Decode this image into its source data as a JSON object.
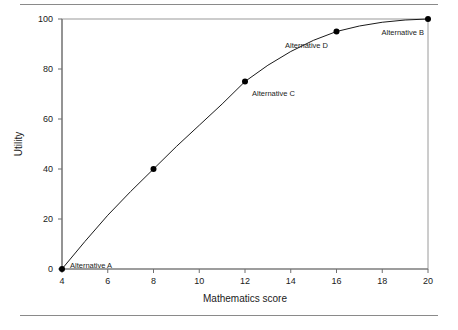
{
  "figure": {
    "background_color": "#ffffff",
    "rule_color": "#8a8a8a",
    "has_top_rule": true,
    "has_bottom_rule": true
  },
  "chart_data": {
    "type": "line",
    "title": "",
    "xlabel": "Mathematics score",
    "ylabel": "Utility",
    "xlim": [
      4,
      20
    ],
    "ylim": [
      0,
      100
    ],
    "xticks": [
      4,
      6,
      8,
      10,
      12,
      14,
      16,
      18,
      20
    ],
    "xtick_labels": [
      "4",
      "6",
      "8",
      "10",
      "12",
      "14",
      "16",
      "18",
      "20"
    ],
    "yticks": [
      0,
      20,
      40,
      60,
      80,
      100
    ],
    "ytick_labels": [
      "0",
      "20",
      "40",
      "60",
      "80",
      "100"
    ],
    "grid": false,
    "legend": false,
    "legend_position": "none",
    "line_color": "#1a1a1a",
    "marker_color": "#000000",
    "marker_style": "filled-circle",
    "frame": true,
    "series": [
      {
        "name": "Utility curve",
        "x": [
          4,
          8,
          12,
          16,
          20
        ],
        "values": [
          0,
          40,
          75,
          95,
          100
        ],
        "point_labels": [
          "Alternative A",
          "",
          "Alternative C",
          "Alternative D",
          "Alternative B"
        ]
      }
    ],
    "curve_points": [
      {
        "x": 4,
        "y": 0
      },
      {
        "x": 5,
        "y": 11
      },
      {
        "x": 6,
        "y": 21.5
      },
      {
        "x": 7,
        "y": 31
      },
      {
        "x": 8,
        "y": 40
      },
      {
        "x": 9,
        "y": 49
      },
      {
        "x": 10,
        "y": 57.5
      },
      {
        "x": 11,
        "y": 66
      },
      {
        "x": 12,
        "y": 75
      },
      {
        "x": 13,
        "y": 81.5
      },
      {
        "x": 14,
        "y": 87
      },
      {
        "x": 15,
        "y": 91.5
      },
      {
        "x": 16,
        "y": 95
      },
      {
        "x": 17,
        "y": 97.2
      },
      {
        "x": 18,
        "y": 98.7
      },
      {
        "x": 19,
        "y": 99.6
      },
      {
        "x": 20,
        "y": 100
      }
    ],
    "annotations": [
      {
        "text": "Alternative A",
        "data_x": 4,
        "data_y": 0
      },
      {
        "text": "Alternative C",
        "data_x": 12,
        "data_y": 75
      },
      {
        "text": "Alternative D",
        "data_x": 16,
        "data_y": 95
      },
      {
        "text": "Alternative B",
        "data_x": 20,
        "data_y": 100
      }
    ]
  },
  "labels": {
    "x_axis_title": "Mathematics score",
    "y_axis_title": "Utility",
    "xt0": "4",
    "xt1": "6",
    "xt2": "8",
    "xt3": "10",
    "xt4": "12",
    "xt5": "14",
    "xt6": "16",
    "xt7": "18",
    "xt8": "20",
    "yt0": "0",
    "yt1": "20",
    "yt2": "40",
    "yt3": "60",
    "yt4": "80",
    "yt5": "100",
    "annotation_a": "Alternative A",
    "annotation_c": "Alternative C",
    "annotation_d": "Alternative D",
    "annotation_b": "Alternative B"
  }
}
